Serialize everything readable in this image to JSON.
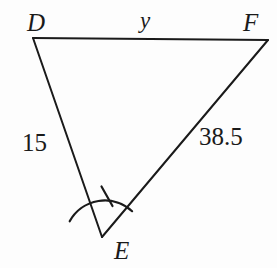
{
  "figure": {
    "type": "triangle-diagram",
    "shape_name": "triangle DEF",
    "background_color": "#fdfdfd",
    "stroke_color": "#1a1a1a",
    "stroke_width": 2
  },
  "vertices": [
    {
      "id": "D",
      "label": "D",
      "x": 33,
      "y": 38,
      "label_x": 27,
      "label_y": 10
    },
    {
      "id": "F",
      "label": "F",
      "x": 268,
      "y": 40,
      "label_x": 243,
      "label_y": 10
    },
    {
      "id": "E",
      "label": "E",
      "x": 102,
      "y": 237,
      "label_x": 114,
      "label_y": 238
    }
  ],
  "sides": [
    {
      "id": "DF",
      "from": "D",
      "to": "F",
      "label": "y",
      "label_x": 140,
      "label_y": 9,
      "is_variable": true
    },
    {
      "id": "DE",
      "from": "D",
      "to": "E",
      "label": "15",
      "label_x": 22,
      "label_y": 130,
      "is_variable": false
    },
    {
      "id": "EF",
      "from": "E",
      "to": "F",
      "label": "38.5",
      "label_x": 199,
      "label_y": 124,
      "is_variable": false
    }
  ],
  "angle_marks": [
    {
      "at_vertex": "E",
      "marks": 1,
      "arc_radius": 40,
      "description": "single-tick angle arc at vertex E"
    }
  ],
  "geometry_paths": {
    "side_DF": "M 33 38 L 268 40",
    "side_DE": "M 33 38 L 102 237",
    "side_EF": "M 102 237 L 268 40",
    "angle_arc_E": "M 69.7 221.3 A 40 40 0 0 1 132.1 211.2",
    "angle_tick_E": "M 101.5 186.5 L 112.5 206.0"
  }
}
